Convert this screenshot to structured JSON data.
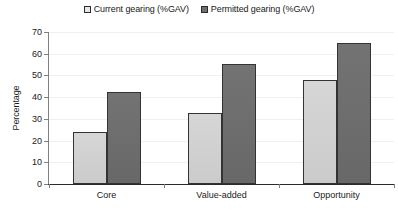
{
  "chart_data": {
    "type": "bar",
    "title": "",
    "subtitle": "",
    "xlabel": "",
    "ylabel": "Percentage",
    "categories": [
      "Core",
      "Value-added",
      "Opportunity"
    ],
    "series": [
      {
        "name": "Current gearing (%GAV)",
        "color": "#d2d2d2",
        "swatch": "light-gray-square",
        "values": [
          24,
          32.5,
          48
        ]
      },
      {
        "name": "Permitted gearing (%GAV)",
        "color": "#6e6e6e",
        "swatch": "dark-gray-square",
        "values": [
          42.5,
          55.5,
          65
        ]
      }
    ],
    "ylim": [
      0,
      70
    ],
    "ytick_step": 10,
    "yticks": [
      0,
      10,
      20,
      30,
      40,
      50,
      60,
      70
    ],
    "ytick_labels": [
      "0",
      "10",
      "20",
      "30",
      "40",
      "50",
      "60",
      "70"
    ],
    "grid": true,
    "grid_axis": "y",
    "grid_color": "#f0f0f0",
    "legend_position": "top-center",
    "axis_color": "#808080",
    "bar_border_color": "#333333",
    "background": "#ffffff",
    "annotations": []
  },
  "legend": {
    "entries": [
      {
        "label": "Current gearing (%GAV)"
      },
      {
        "label": "Permitted gearing (%GAV)"
      }
    ]
  }
}
